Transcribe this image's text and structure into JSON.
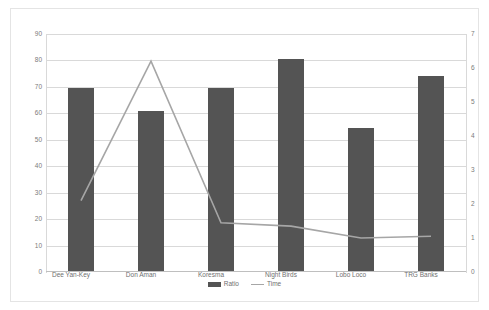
{
  "chart_data": {
    "type": "bar",
    "title": "",
    "subtitle": "",
    "xlabel": "",
    "ylabel": "",
    "categories": [
      "Dee Yan-Key",
      "Don Aman",
      "Koresma",
      "Night Birds",
      "Lobo Loco",
      "TRG Banks"
    ],
    "series": [
      {
        "name": "Ratio",
        "type": "bar",
        "axis": "left",
        "color": "#545454",
        "values": [
          69.5,
          61,
          69.5,
          80.5,
          54.5,
          74
        ]
      },
      {
        "name": "Time",
        "type": "line",
        "axis": "right",
        "color": "#a6a6a6",
        "values": [
          2.1,
          6.2,
          1.45,
          1.35,
          1.0,
          1.05
        ]
      }
    ],
    "axes": {
      "left": {
        "min": 0,
        "max": 90,
        "step": 10,
        "ticks": [
          "0",
          "10",
          "20",
          "30",
          "40",
          "50",
          "60",
          "70",
          "80",
          "90"
        ]
      },
      "right": {
        "min": 0,
        "max": 7,
        "step": 1,
        "ticks": [
          "0",
          "1",
          "2",
          "3",
          "4",
          "5",
          "6",
          "7"
        ]
      }
    },
    "grid": true,
    "legend_position": "bottom",
    "legend": [
      {
        "label": "Ratio",
        "marker": "bar",
        "color": "#545454"
      },
      {
        "label": "Time",
        "marker": "line",
        "color": "#a6a6a6"
      }
    ]
  }
}
